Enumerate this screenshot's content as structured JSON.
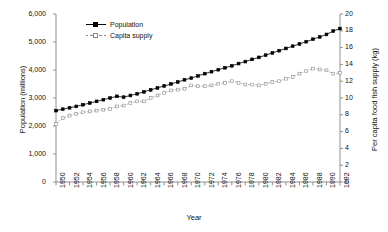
{
  "chart_data": {
    "type": "line",
    "title": "",
    "xlabel": "Year",
    "ylabel": "Population (millions)",
    "ylabel_right": "Per capita food fish supply (kg)",
    "xlim": [
      1950,
      1992
    ],
    "ylim": [
      0,
      6000
    ],
    "ylim_right": [
      0,
      20
    ],
    "grid": false,
    "legend_position": "top-left",
    "ytick_labels_left": [
      "0",
      "1,000",
      "2,000",
      "3,000",
      "4,000",
      "5,000",
      "6,000"
    ],
    "ytick_values_left": [
      0,
      1000,
      2000,
      3000,
      4000,
      5000,
      6000
    ],
    "ytick_labels_right": [
      "0",
      "2",
      "4",
      "6",
      "8",
      "10",
      "12",
      "14",
      "16",
      "18",
      "20"
    ],
    "ytick_values_right": [
      0,
      2,
      4,
      6,
      8,
      10,
      12,
      14,
      16,
      18,
      20
    ],
    "xtick_labels": [
      "1950",
      "1952",
      "1954",
      "1956",
      "1958",
      "1960",
      "1962",
      "1964",
      "1966",
      "1968",
      "1970",
      "1972",
      "1974",
      "1976",
      "1978",
      "1980",
      "1982",
      "1984",
      "1986",
      "1988",
      "1990",
      "1992"
    ],
    "x": [
      1950,
      1951,
      1952,
      1953,
      1954,
      1955,
      1956,
      1957,
      1958,
      1959,
      1960,
      1961,
      1962,
      1963,
      1964,
      1965,
      1966,
      1967,
      1968,
      1969,
      1970,
      1971,
      1972,
      1973,
      1974,
      1975,
      1976,
      1977,
      1978,
      1979,
      1980,
      1981,
      1982,
      1983,
      1984,
      1985,
      1986,
      1987,
      1988,
      1989,
      1990,
      1991,
      1992
    ],
    "series": [
      {
        "name": "Population",
        "axis": "left",
        "unit": "millions",
        "marker": "filled-square",
        "color": "#000000",
        "values": [
          2550,
          2600,
          2650,
          2700,
          2760,
          2820,
          2880,
          2940,
          3000,
          3060,
          3030,
          3090,
          3150,
          3220,
          3290,
          3360,
          3430,
          3500,
          3570,
          3650,
          3710,
          3790,
          3870,
          3940,
          4010,
          4080,
          4150,
          4230,
          4300,
          4380,
          4450,
          4530,
          4610,
          4690,
          4770,
          4850,
          4930,
          5010,
          5100,
          5180,
          5270,
          5390,
          5480
        ]
      },
      {
        "name": "Capita supply",
        "axis": "right",
        "unit": "kg",
        "marker": "open-square",
        "color": "#8a8a8a",
        "values": [
          6.9,
          7.6,
          7.9,
          8.1,
          8.3,
          8.4,
          8.5,
          8.6,
          8.7,
          9.0,
          9.1,
          9.4,
          9.6,
          9.6,
          10.0,
          10.3,
          10.6,
          10.9,
          11.0,
          11.1,
          11.5,
          11.4,
          11.4,
          11.5,
          11.7,
          11.8,
          12.0,
          11.8,
          11.6,
          11.6,
          11.5,
          11.7,
          11.9,
          12.0,
          12.3,
          12.5,
          12.9,
          13.2,
          13.5,
          13.4,
          13.3,
          12.9,
          13.0
        ]
      }
    ]
  },
  "legend": {
    "items": [
      {
        "label": "Population"
      },
      {
        "label": "Capita supply"
      }
    ]
  }
}
